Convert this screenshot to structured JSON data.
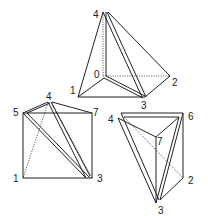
{
  "figures": [
    {
      "name": "top-tetrahedron",
      "labels": {
        "v4": "4",
        "v0": "0",
        "v1": "1",
        "v2": "2",
        "v3": "3"
      }
    },
    {
      "name": "left-cube-split",
      "labels": {
        "v4": "4",
        "v5": "5",
        "v7": "7",
        "v1": "1",
        "v3": "3"
      }
    },
    {
      "name": "right-prism-split",
      "labels": {
        "v4": "4",
        "v6": "6",
        "v7": "7",
        "v2": "2",
        "v3": "3"
      }
    }
  ]
}
